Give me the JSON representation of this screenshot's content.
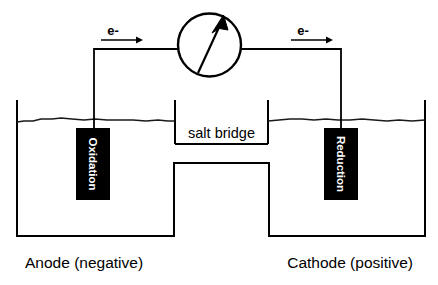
{
  "diagram": {
    "type": "schematic",
    "background_color": "#ffffff",
    "line_color": "#000000",
    "electrode_fill": "#000000",
    "electrode_text_color": "#ffffff"
  },
  "meter": {
    "name": "voltmeter",
    "needle_direction": "up-right",
    "label": ""
  },
  "electron_flow": {
    "left": {
      "label": "e-",
      "direction": "right"
    },
    "right": {
      "label": "e-",
      "direction": "right"
    }
  },
  "salt_bridge": {
    "label": "salt bridge"
  },
  "electrodes": [
    {
      "id": "anode-electrode",
      "label": "Oxidation",
      "orientation": "vertical",
      "side": "left"
    },
    {
      "id": "cathode-electrode",
      "label": "Reduction",
      "orientation": "vertical",
      "side": "right"
    }
  ],
  "captions": {
    "left": "Anode (negative)",
    "right": "Cathode (positive)"
  }
}
